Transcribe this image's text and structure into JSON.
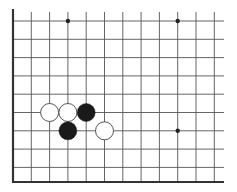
{
  "board": {
    "title": "Go board diagram",
    "background": "#ffffff",
    "line_color": "#555555",
    "edge_color": "#333333",
    "columns_x": [
      13,
      31.3,
      49.6,
      67.9,
      86.2,
      104.5,
      122.8,
      141.1,
      159.4,
      177.7,
      196,
      214.3
    ],
    "rows_y": [
      21,
      39.3,
      57.6,
      75.9,
      94.2,
      112.5,
      130.8,
      149.1,
      167.4
    ],
    "bottom_edge_y": 182,
    "left_edge_x": 13,
    "top_stub_y": 12,
    "right_extent_x": 224,
    "line_width": 0.9,
    "edge_width": 2.2,
    "edges": {
      "left": true,
      "bottom": true,
      "top": false,
      "right": false
    },
    "star_points": [
      {
        "col": 3,
        "row": 0
      },
      {
        "col": 9,
        "row": 0
      },
      {
        "col": 9,
        "row": 6
      }
    ],
    "star_radius": 2.2,
    "stone_radius": 9,
    "stones": [
      {
        "color": "white",
        "col": 2,
        "row": 5
      },
      {
        "color": "white",
        "col": 3,
        "row": 5
      },
      {
        "color": "black",
        "col": 4,
        "row": 5
      },
      {
        "color": "black",
        "col": 3,
        "row": 6
      },
      {
        "color": "white",
        "col": 5,
        "row": 6
      }
    ],
    "stone_colors": {
      "black": "#1a1a1a",
      "white": "#ffffff",
      "outline": "#444444"
    }
  }
}
